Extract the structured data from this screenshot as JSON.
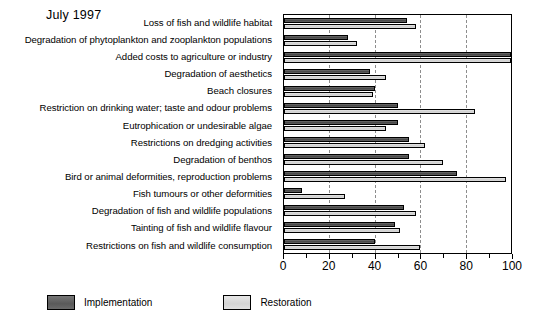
{
  "chart_data": {
    "type": "bar",
    "orientation": "horizontal",
    "title": "July 1997",
    "xlabel": "",
    "ylabel": "",
    "xlim": [
      0,
      100
    ],
    "xticks": [
      0,
      20,
      40,
      60,
      80,
      100
    ],
    "xtick_labels": [
      "0",
      "20",
      "40",
      "60",
      "80",
      "100"
    ],
    "minor_tick_interval": 10,
    "gridlines": [
      20,
      40,
      60,
      80
    ],
    "grid": true,
    "legend_position": "bottom-left",
    "categories": [
      "Loss of fish and wildlife habitat",
      "Degradation of phytoplankton and zooplankton populations",
      "Added costs to agriculture or industry",
      "Degradation of aesthetics",
      "Beach closures",
      "Restriction on drinking water; taste and odour problems",
      "Eutrophication or undesirable algae",
      "Restrictions on dredging activities",
      "Degradation of benthos",
      "Bird or animal deformities, reproduction problems",
      "Fish tumours or other deformities",
      "Degradation of fish and wildlife populations",
      "Tainting of fish and wildlife flavour",
      "Restrictions on fish and wildlife consumption"
    ],
    "series": [
      {
        "name": "Implementation",
        "color": "#5e5e5e",
        "values": [
          54,
          28,
          100,
          38,
          40,
          50,
          50,
          55,
          55,
          76,
          8,
          53,
          49,
          40
        ]
      },
      {
        "name": "Restoration",
        "color": "#d8d8d8",
        "values": [
          58,
          32,
          100,
          45,
          39,
          84,
          45,
          62,
          70,
          98,
          27,
          58,
          51,
          60
        ]
      }
    ]
  },
  "legend": {
    "items": [
      {
        "label": "Implementation",
        "swatch": "dark-gray"
      },
      {
        "label": "Restoration",
        "swatch": "light-gray"
      }
    ]
  }
}
